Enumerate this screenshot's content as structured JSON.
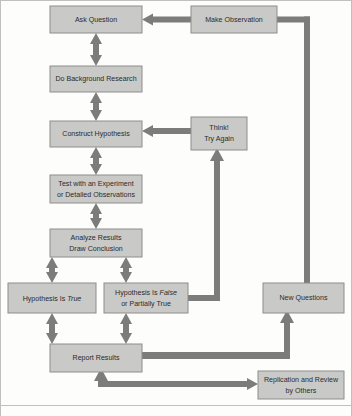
{
  "diagram": {
    "type": "flowchart",
    "colors": {
      "node_fill": "#c9c9c7",
      "node_border": "#8d8d8b",
      "connector": "#7c7c7a",
      "text": "#2b2b2b",
      "background": "#fdfdfc"
    },
    "nodes": [
      {
        "id": "ask-question",
        "lines": [
          "Ask Question"
        ],
        "x": 50,
        "y": 6,
        "w": 92,
        "h": 27
      },
      {
        "id": "make-observation",
        "lines": [
          "Make Observation"
        ],
        "x": 191,
        "y": 6,
        "w": 86,
        "h": 27
      },
      {
        "id": "do-background-research",
        "lines": [
          "Do Background Research"
        ],
        "x": 50,
        "y": 66,
        "w": 92,
        "h": 26
      },
      {
        "id": "construct-hypothesis",
        "lines": [
          "Construct Hypothesis"
        ],
        "x": 50,
        "y": 121,
        "w": 92,
        "h": 26
      },
      {
        "id": "think-try-again",
        "lines": [
          "Think!",
          "Try Again"
        ],
        "x": 191,
        "y": 117,
        "w": 56,
        "h": 33
      },
      {
        "id": "test-experiment",
        "lines": [
          "Test with an Experiment",
          "or Detailed Observations"
        ],
        "x": 50,
        "y": 175,
        "w": 92,
        "h": 28
      },
      {
        "id": "analyze-results",
        "lines": [
          "Analyze Results",
          "Draw Conclusion"
        ],
        "x": 50,
        "y": 229,
        "w": 92,
        "h": 28
      },
      {
        "id": "hypothesis-true",
        "lines": [
          "Hypothesis Is |True|"
        ],
        "x": 8,
        "y": 283,
        "w": 88,
        "h": 30
      },
      {
        "id": "hypothesis-false",
        "lines": [
          "Hypothesis Is |False|",
          "or Partially True"
        ],
        "x": 104,
        "y": 283,
        "w": 84,
        "h": 30
      },
      {
        "id": "new-questions",
        "lines": [
          "New Questions"
        ],
        "x": 263,
        "y": 283,
        "w": 81,
        "h": 30
      },
      {
        "id": "report-results",
        "lines": [
          "Report Results"
        ],
        "x": 50,
        "y": 344,
        "w": 92,
        "h": 28
      },
      {
        "id": "replication-review",
        "lines": [
          "Replication and Review",
          "by Others"
        ],
        "x": 258,
        "y": 371,
        "w": 86,
        "h": 28
      }
    ],
    "connections": [
      {
        "id": "observation-to-question",
        "from": "make-observation",
        "to": "ask-question",
        "style": "single-arrow",
        "direction": "left"
      },
      {
        "id": "question-background",
        "from": "ask-question",
        "to": "do-background-research",
        "style": "double-arrow",
        "direction": "vertical"
      },
      {
        "id": "background-hypothesis",
        "from": "do-background-research",
        "to": "construct-hypothesis",
        "style": "double-arrow",
        "direction": "vertical"
      },
      {
        "id": "hypothesis-test",
        "from": "construct-hypothesis",
        "to": "test-experiment",
        "style": "double-arrow",
        "direction": "vertical"
      },
      {
        "id": "test-analyze",
        "from": "test-experiment",
        "to": "analyze-results",
        "style": "double-arrow",
        "direction": "vertical"
      },
      {
        "id": "analyze-true",
        "from": "analyze-results",
        "to": "hypothesis-true",
        "style": "double-arrow",
        "direction": "vertical"
      },
      {
        "id": "analyze-false",
        "from": "analyze-results",
        "to": "hypothesis-false",
        "style": "double-arrow",
        "direction": "vertical"
      },
      {
        "id": "true-report",
        "from": "hypothesis-true",
        "to": "report-results",
        "style": "double-arrow",
        "direction": "vertical"
      },
      {
        "id": "false-report",
        "from": "hypothesis-false",
        "to": "report-results",
        "style": "double-arrow",
        "direction": "vertical"
      },
      {
        "id": "false-to-think",
        "from": "hypothesis-false",
        "to": "think-try-again",
        "style": "single-arrow",
        "direction": "up"
      },
      {
        "id": "think-to-hypothesis",
        "from": "think-try-again",
        "to": "construct-hypothesis",
        "style": "single-arrow",
        "direction": "left"
      },
      {
        "id": "report-to-replication",
        "from": "report-results",
        "to": "replication-review",
        "style": "single-arrow",
        "direction": "right"
      },
      {
        "id": "replication-to-report",
        "from": "replication-review",
        "to": "report-results",
        "style": "single-arrow",
        "direction": "up"
      },
      {
        "id": "report-to-new-questions",
        "from": "report-results",
        "to": "new-questions",
        "style": "single-arrow",
        "direction": "up"
      },
      {
        "id": "new-questions-to-observation",
        "from": "new-questions",
        "to": "make-observation",
        "style": "line",
        "direction": "up"
      }
    ]
  }
}
